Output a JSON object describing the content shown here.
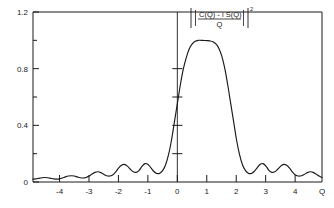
{
  "chart_data": {
    "type": "line",
    "title": "",
    "subtitle": "",
    "xlabel": "Q",
    "ylabel": "",
    "annotation": {
      "numerator": "C(Q) - i S(Q)",
      "denominator": "Q",
      "exponent": "2",
      "bar_left": "|",
      "bar_right": "|",
      "full_text": "|[C(Q) - i S(Q)] / Q|^2"
    },
    "xlim": [
      -4.9,
      4.9
    ],
    "ylim": [
      0,
      1.2
    ],
    "grid": false,
    "legend": null,
    "x_ticks": [
      -4,
      -3,
      -2,
      -1,
      0,
      1,
      2,
      3,
      4
    ],
    "x_tick_labels": [
      "-4",
      "-3",
      "-2",
      "-1",
      "0",
      "1",
      "2",
      "3",
      "4"
    ],
    "y_ticks": [
      0,
      0.4,
      0.8,
      1.2
    ],
    "y_tick_labels": [
      "0",
      "0.4",
      "0.8",
      "1.2"
    ],
    "y_minor_ticks": [
      0.2,
      0.6,
      1.0
    ],
    "center_axis_x": 0,
    "center_axis_ticks": [
      0.2,
      0.4,
      0.6,
      0.8
    ],
    "series": [
      {
        "name": "Fresnel intensity",
        "color": "#1a1a1a",
        "x": [
          -4.9,
          -4.8,
          -4.7,
          -4.6,
          -4.5,
          -4.4,
          -4.3,
          -4.2,
          -4.1,
          -4.0,
          -3.9,
          -3.8,
          -3.7,
          -3.6,
          -3.5,
          -3.4,
          -3.3,
          -3.2,
          -3.1,
          -3.0,
          -2.9,
          -2.8,
          -2.7,
          -2.6,
          -2.5,
          -2.4,
          -2.3,
          -2.2,
          -2.1,
          -2.0,
          -1.9,
          -1.8,
          -1.7,
          -1.6,
          -1.5,
          -1.4,
          -1.3,
          -1.2,
          -1.1,
          -1.0,
          -0.9,
          -0.8,
          -0.7,
          -0.6,
          -0.5,
          -0.4,
          -0.3,
          -0.2,
          -0.1,
          0.0,
          0.1,
          0.2,
          0.3,
          0.4,
          0.5,
          0.6,
          0.7,
          0.8,
          0.9,
          1.0,
          1.1,
          1.2,
          1.3,
          1.4,
          1.5,
          1.6,
          1.7,
          1.8,
          1.9,
          2.0,
          2.1,
          2.2,
          2.3,
          2.4,
          2.5,
          2.6,
          2.7,
          2.8,
          2.9,
          3.0,
          3.1,
          3.2,
          3.3,
          3.4,
          3.5,
          3.6,
          3.7,
          3.8,
          3.9,
          4.0,
          4.1,
          4.2,
          4.3,
          4.4,
          4.5,
          4.6,
          4.7,
          4.8,
          4.9
        ],
        "y": [
          0.02,
          0.022,
          0.026,
          0.03,
          0.032,
          0.03,
          0.026,
          0.022,
          0.02,
          0.022,
          0.028,
          0.036,
          0.042,
          0.044,
          0.042,
          0.036,
          0.03,
          0.028,
          0.032,
          0.042,
          0.056,
          0.068,
          0.072,
          0.066,
          0.054,
          0.044,
          0.042,
          0.05,
          0.07,
          0.098,
          0.118,
          0.124,
          0.112,
          0.09,
          0.072,
          0.068,
          0.082,
          0.112,
          0.13,
          0.124,
          0.1,
          0.074,
          0.06,
          0.062,
          0.082,
          0.124,
          0.196,
          0.3,
          0.43,
          0.56,
          0.69,
          0.8,
          0.88,
          0.94,
          0.975,
          0.993,
          1.0,
          1.0,
          0.999,
          0.998,
          0.996,
          0.99,
          0.975,
          0.945,
          0.89,
          0.805,
          0.69,
          0.56,
          0.43,
          0.3,
          0.196,
          0.124,
          0.082,
          0.062,
          0.06,
          0.074,
          0.1,
          0.124,
          0.13,
          0.112,
          0.082,
          0.068,
          0.072,
          0.09,
          0.112,
          0.124,
          0.118,
          0.098,
          0.07,
          0.05,
          0.042,
          0.044,
          0.054,
          0.066,
          0.072,
          0.068,
          0.056,
          0.042,
          0.032
        ]
      }
    ]
  },
  "figure": {
    "background_color": "#ffffff",
    "line_color": "#1a1a1a",
    "axis_color": "#1a1a1a"
  }
}
